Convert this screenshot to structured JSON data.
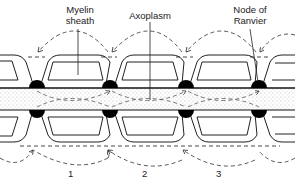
{
  "labels": {
    "myelin_line1": "Myelin",
    "myelin_line2": "sheath",
    "axoplasm": "Axoplasm",
    "node_line1": "Node of",
    "node_line2": "Ranvier"
  },
  "segments": [
    "1",
    "2",
    "3"
  ],
  "colors": {
    "ink": "#222222",
    "stipple": "#bdbdbd",
    "node": "#000000"
  }
}
